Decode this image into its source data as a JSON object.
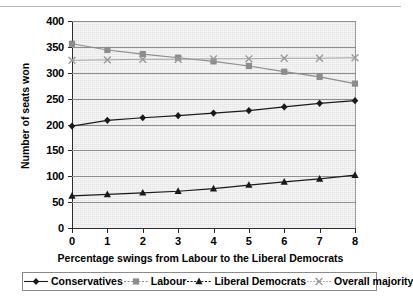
{
  "chart_data": {
    "type": "line",
    "title": "",
    "xlabel": "Percentage swings from Labour to the Liberal Democrats",
    "ylabel": "Number of seats won",
    "x": [
      0,
      1,
      2,
      3,
      4,
      5,
      6,
      7,
      8
    ],
    "xlim": [
      0,
      8
    ],
    "ylim": [
      0,
      400
    ],
    "ytick_step": 50,
    "xtick_labels": [
      "0",
      "1",
      "2",
      "3",
      "4",
      "5",
      "6",
      "7",
      "8"
    ],
    "ytick_labels": [
      "0",
      "50",
      "100",
      "150",
      "200",
      "250",
      "300",
      "350",
      "400"
    ],
    "grid": "horizontal",
    "legend_position": "bottom",
    "plot_background": "#e4e4e4",
    "series": [
      {
        "name": "Conservatives",
        "marker": "diamond",
        "color": "#1a1a1a",
        "values": [
          197,
          208,
          213,
          217,
          222,
          227,
          234,
          241,
          246
        ]
      },
      {
        "name": "Labour",
        "marker": "square",
        "color": "#8c8c8c",
        "values": [
          356,
          344,
          336,
          329,
          322,
          313,
          302,
          292,
          279
        ]
      },
      {
        "name": "Liberal Democrats",
        "marker": "triangle",
        "color": "#1a1a1a",
        "values": [
          62,
          65,
          68,
          71,
          76,
          83,
          89,
          95,
          102
        ]
      },
      {
        "name": "Overall majority",
        "marker": "x",
        "color": "#9a9a9a",
        "values": [
          324,
          325,
          326,
          326,
          327,
          327,
          328,
          328,
          329
        ]
      }
    ]
  },
  "legend": {
    "items": [
      {
        "label": "Conservatives",
        "marker": "diamond-marker-icon"
      },
      {
        "label": "Labour",
        "marker": "square-marker-icon"
      },
      {
        "label": "Liberal Democrats",
        "marker": "triangle-marker-icon"
      },
      {
        "label": "Overall majority",
        "marker": "cross-marker-icon"
      }
    ]
  }
}
